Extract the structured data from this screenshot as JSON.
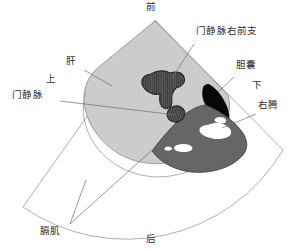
{
  "figure": {
    "type": "ultrasound-anatomy-schematic",
    "modality_view": "right upper quadrant sagittal/oblique sector scan",
    "background_color": "#ffffff",
    "outline_color": "#8c8c8c"
  },
  "sector": {
    "apex": {
      "x": 155,
      "y": 20
    },
    "description": "fan-shaped (sector) ultrasound scan field outline",
    "fill": "#ffffff",
    "stroke": "#999999"
  },
  "structures": [
    {
      "id": "liver",
      "label": "肝",
      "fill": "#cccccc",
      "stroke": "#8a8a8a",
      "echo": "homogeneous mid-gray parenchyma"
    },
    {
      "id": "portal-vein-right-anterior-branch",
      "label": "门静脉右前支",
      "fill": "#5a5a5a",
      "stroke": "#2b2b2b",
      "echo": "hatched anechoic branching vessel"
    },
    {
      "id": "portal-vein",
      "label": "门静脉",
      "fill": "#5a5a5a",
      "stroke": "#2b2b2b",
      "echo": "hatched anechoic vessel in cross-section"
    },
    {
      "id": "gallbladder",
      "label": "胆囊",
      "fill": "#080808",
      "stroke": "#000000",
      "echo": "anechoic (black) fluid-filled"
    },
    {
      "id": "right-kidney",
      "label": "右肾",
      "fill": "#666666",
      "stroke": "#3d3d3d",
      "echo": "hypoechoic cortex with echogenic white sinus"
    },
    {
      "id": "diaphragm",
      "label": "膈肌",
      "fill": "none",
      "stroke": "#8a8a8a",
      "echo": "thin bright curvilinear line"
    }
  ],
  "callouts": [
    {
      "id": "portal-vein-right-anterior-branch",
      "text": "门静脉右前支",
      "label_x": 196,
      "label_y": 31,
      "leader": [
        [
          194,
          44
        ],
        [
          172,
          78
        ]
      ]
    },
    {
      "id": "gallbladder",
      "text": "胆囊",
      "label_x": 236,
      "label_y": 66,
      "leader": [
        [
          234,
          77
        ],
        [
          218,
          92
        ]
      ]
    },
    {
      "id": "right-kidney",
      "text": "右腾",
      "label_x": 258,
      "label_y": 106,
      "leader": [
        [
          256,
          114
        ],
        [
          222,
          128
        ]
      ]
    },
    {
      "id": "liver",
      "text": "肝",
      "label_x": 68,
      "label_y": 63,
      "leader": [
        [
          84,
          70
        ],
        [
          112,
          86
        ]
      ]
    },
    {
      "id": "portal-vein",
      "text": "门静脉",
      "label_x": 14,
      "label_y": 96,
      "leader": [
        [
          60,
          101
        ],
        [
          176,
          115
        ]
      ]
    },
    {
      "id": "diaphragm",
      "text": "膈肌",
      "label_x": 42,
      "label_y": 228,
      "leader": [
        [
          70,
          226
        ],
        [
          86,
          180
        ]
      ]
    }
  ],
  "orientation_markers": [
    {
      "id": "anterior",
      "text": "前",
      "x": 148,
      "y": 2
    },
    {
      "id": "posterior",
      "text": "后",
      "x": 148,
      "y": 236
    },
    {
      "id": "superior",
      "text": "上",
      "x": 48,
      "y": 79
    },
    {
      "id": "inferior",
      "text": "下",
      "x": 254,
      "y": 84
    }
  ],
  "colors": {
    "liver_gray": "#cccccc",
    "kidney_gray": "#666666",
    "vessel_gray": "#5a5a5a",
    "gallbladder_black": "#080808",
    "sinus_white": "#ffffff",
    "line_gray": "#8c8c8c",
    "text_color": "#2b2b2b"
  }
}
